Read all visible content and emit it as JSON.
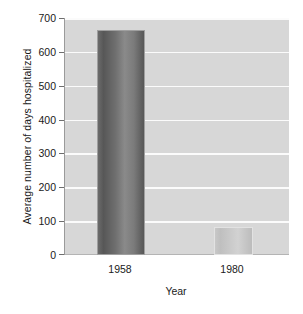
{
  "chart_data": {
    "type": "bar",
    "title": "",
    "subtitle": "",
    "xlabel": "Year",
    "ylabel": "Average number of days hospitalized",
    "categories": [
      "1958",
      "1980"
    ],
    "values": [
      665,
      82
    ],
    "series": [
      {
        "name": "Average number of days hospitalized",
        "values": [
          665,
          82
        ]
      }
    ],
    "ylim": [
      0,
      700
    ],
    "y_ticks": [
      "700",
      "600",
      "500",
      "400",
      "300",
      "200",
      "100",
      "0"
    ],
    "y_tick_values": [
      700,
      600,
      500,
      400,
      300,
      200,
      100,
      0
    ],
    "grid": true,
    "grid_axis": "y",
    "legend": false,
    "legend_position": "none",
    "annotations": [],
    "bar_colors": [
      "#6f6f6f",
      "#c8c8c8"
    ],
    "plot_background": "#d7d7d7",
    "gridline_color": "#fbfbfb",
    "page_background": "#ffffff",
    "text_color": "#1a1a1a"
  }
}
